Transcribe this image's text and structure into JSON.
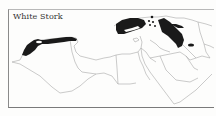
{
  "map": {
    "title": "White Stork",
    "legend_meaning": "breeding range",
    "colors": {
      "range_fill": "#1a1a1a",
      "border_stroke": "#a8a8a8",
      "frame": "#7a7a7a",
      "background": "#fdfdfc"
    },
    "regions_shaded": [
      "northwest-africa",
      "turkey",
      "caucasus-iran",
      "eastern-iran-spot"
    ]
  }
}
